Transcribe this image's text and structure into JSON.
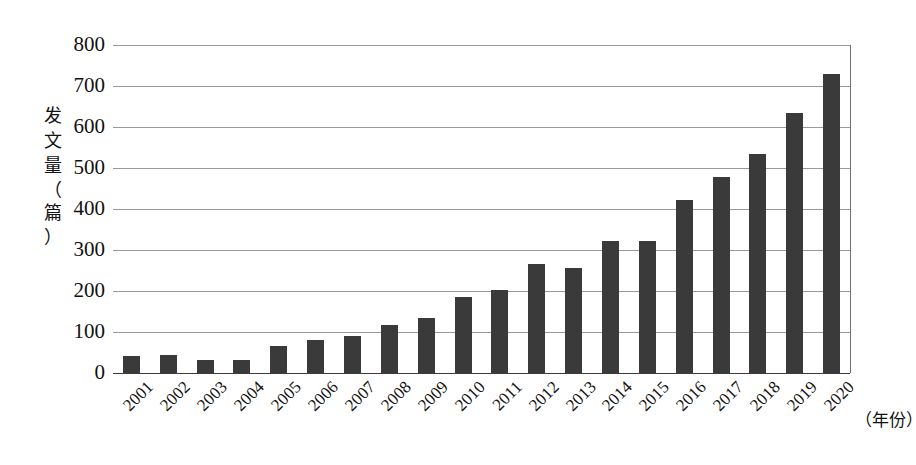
{
  "chart_data": {
    "type": "bar",
    "title": "",
    "subtitle": "",
    "xlabel": "（年份）",
    "ylabel": "发文量（篇）",
    "ylabel_chars": [
      "发",
      "文",
      "量",
      "（",
      "篇",
      "）"
    ],
    "categories": [
      "2001",
      "2002",
      "2003",
      "2004",
      "2005",
      "2006",
      "2007",
      "2008",
      "2009",
      "2010",
      "2011",
      "2012",
      "2013",
      "2014",
      "2015",
      "2016",
      "2017",
      "2018",
      "2019",
      "2020"
    ],
    "values": [
      42,
      45,
      32,
      31,
      66,
      80,
      90,
      118,
      134,
      185,
      202,
      265,
      257,
      322,
      322,
      422,
      477,
      535,
      635,
      730
    ],
    "ylim": [
      0,
      800
    ],
    "y_ticks": [
      800,
      700,
      600,
      500,
      400,
      300,
      200,
      100,
      0
    ],
    "grid": true,
    "legend": "none",
    "legend_position": "none",
    "bar_color": "#3a3a3a",
    "grid_color": "#9a9a9a",
    "axis_color": "#3b3b3b",
    "background_color": "#ffffff"
  }
}
